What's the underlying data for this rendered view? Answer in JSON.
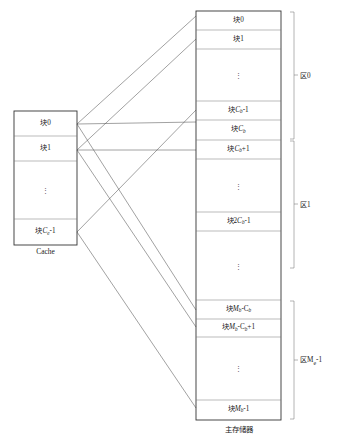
{
  "diagram": {
    "stroke_color": "#555555",
    "text_color": "#1a1a1a"
  },
  "cache": {
    "caption": "Cache",
    "rows": [
      {
        "id": "cache-block-0",
        "label_prefix": "块",
        "label_main": "0",
        "sub": "",
        "label_suffix": "",
        "type": "label"
      },
      {
        "id": "cache-block-1",
        "label_prefix": "块",
        "label_main": "1",
        "sub": "",
        "label_suffix": "",
        "type": "label"
      },
      {
        "id": "cache-ellipsis",
        "label_prefix": "",
        "label_main": "",
        "sub": "",
        "label_suffix": "",
        "type": "ellipsis"
      },
      {
        "id": "cache-block-ce-1",
        "label_prefix": "块",
        "label_main": "C",
        "sub": "e",
        "label_suffix": "-1",
        "type": "label"
      }
    ]
  },
  "main_memory": {
    "caption": "主存储器",
    "rows": [
      {
        "id": "mm-block-0",
        "label_prefix": "块",
        "label_main": "0",
        "sub": "",
        "label_suffix": "",
        "type": "label"
      },
      {
        "id": "mm-block-1",
        "label_prefix": "块",
        "label_main": "1",
        "sub": "",
        "label_suffix": "",
        "type": "label"
      },
      {
        "id": "mm-ellipsis-1",
        "label_prefix": "",
        "label_main": "",
        "sub": "",
        "label_suffix": "",
        "type": "ellipsis"
      },
      {
        "id": "mm-block-cb-1",
        "label_prefix": "块",
        "label_main": "C",
        "sub": "b",
        "label_suffix": "-1",
        "type": "label"
      },
      {
        "id": "mm-block-cb",
        "label_prefix": "块",
        "label_main": "C",
        "sub": "b",
        "label_suffix": "",
        "type": "label"
      },
      {
        "id": "mm-block-cb-plus-1",
        "label_prefix": "块",
        "label_main": "C",
        "sub": "b",
        "label_suffix": "+1",
        "type": "label"
      },
      {
        "id": "mm-ellipsis-2",
        "label_prefix": "",
        "label_main": "",
        "sub": "",
        "label_suffix": "",
        "type": "ellipsis"
      },
      {
        "id": "mm-block-2cb-1",
        "label_prefix": "块2",
        "label_main": "C",
        "sub": "b",
        "label_suffix": "-1",
        "type": "label"
      },
      {
        "id": "mm-ellipsis-3",
        "label_prefix": "",
        "label_main": "",
        "sub": "",
        "label_suffix": "",
        "type": "ellipsis"
      },
      {
        "id": "mm-block-mb-cb",
        "label_prefix": "块",
        "label_main": "M",
        "sub": "b",
        "label_suffix": "-C",
        "sub2": "b",
        "type": "label2"
      },
      {
        "id": "mm-block-mb-cb-plus-1",
        "label_prefix": "块",
        "label_main": "M",
        "sub": "b",
        "label_suffix": "-C",
        "sub2": "b",
        "tail": "+1",
        "type": "label2"
      },
      {
        "id": "mm-ellipsis-4",
        "label_prefix": "",
        "label_main": "",
        "sub": "",
        "label_suffix": "",
        "type": "ellipsis"
      },
      {
        "id": "mm-block-mb-1",
        "label_prefix": "块",
        "label_main": "M",
        "sub": "b",
        "label_suffix": "-1",
        "type": "label"
      }
    ]
  },
  "regions": [
    {
      "id": "region-0",
      "prefix": "区",
      "main": "0",
      "sub": "",
      "suffix": ""
    },
    {
      "id": "region-1",
      "prefix": "区",
      "main": "1",
      "sub": "",
      "suffix": ""
    },
    {
      "id": "region-me-1",
      "prefix": "区",
      "main": "M",
      "sub": "e",
      "suffix": "-1"
    }
  ]
}
